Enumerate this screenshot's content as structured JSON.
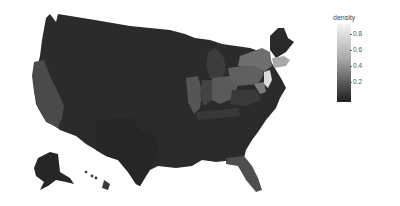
{
  "legend": {
    "title": "density",
    "ticks": [
      "0.8",
      "0.6",
      "0.4",
      "0.2"
    ],
    "gradient_low": "#1e1e1e",
    "gradient_high": "#f4f4f4"
  },
  "map": {
    "type": "choropleth",
    "region": "United States (with Alaska and Hawaii insets)",
    "variable": "density"
  },
  "colors": {
    "darkest": "#262626",
    "dark": "#303030",
    "mid_dark": "#3c3c3c",
    "mid": "#555555",
    "mid_light": "#6e6e6e",
    "light": "#a8a8a8",
    "lightest": "#dcdcdc"
  }
}
